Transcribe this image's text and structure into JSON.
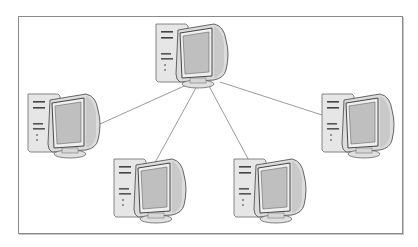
{
  "diagram": {
    "type": "star-network",
    "colors": {
      "border": "#8a8a8a",
      "line": "#9a9a9a",
      "tower": "#e4e4e4",
      "monitor": "#d8d8d8",
      "screen": "#bcbcbc",
      "outline": "#555555"
    },
    "nodes": [
      {
        "id": "center",
        "icon": "desktop-computer-icon",
        "x": 152,
        "y": 20
      },
      {
        "id": "left",
        "icon": "desktop-computer-icon",
        "x": 24,
        "y": 90
      },
      {
        "id": "right",
        "icon": "desktop-computer-icon",
        "x": 318,
        "y": 90
      },
      {
        "id": "bottom-left",
        "icon": "desktop-computer-icon",
        "x": 110,
        "y": 155
      },
      {
        "id": "bottom-right",
        "icon": "desktop-computer-icon",
        "x": 230,
        "y": 155
      }
    ],
    "links": [
      {
        "from": "center",
        "to": "left",
        "x1": 193,
        "y1": 82,
        "x2": 100,
        "y2": 124
      },
      {
        "from": "center",
        "to": "bottom-left",
        "x1": 197,
        "y1": 86,
        "x2": 152,
        "y2": 168
      },
      {
        "from": "center",
        "to": "bottom-right",
        "x1": 209,
        "y1": 86,
        "x2": 253,
        "y2": 168
      },
      {
        "from": "center",
        "to": "right",
        "x1": 220,
        "y1": 82,
        "x2": 322,
        "y2": 115
      }
    ]
  }
}
